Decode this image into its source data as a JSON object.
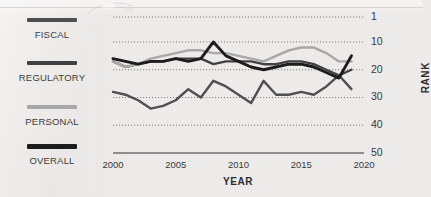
{
  "legend": {
    "items": [
      {
        "label": "FISCAL",
        "color": "#4f4f51"
      },
      {
        "label": "REGULATORY",
        "color": "#414143"
      },
      {
        "label": "PERSONAL",
        "color": "#a8a8a8"
      },
      {
        "label": "OVERALL",
        "color": "#1c1c1c"
      }
    ]
  },
  "axis": {
    "y_title": "RANK",
    "x_title": "YEAR",
    "y_ticks": [
      "1",
      "10",
      "20",
      "30",
      "40",
      "50"
    ],
    "x_ticks": [
      "2000",
      "2005",
      "2010",
      "2015",
      "2020"
    ]
  },
  "chart_data": {
    "type": "line",
    "title": "",
    "xlabel": "YEAR",
    "ylabel": "RANK",
    "xlim": [
      2000,
      2020
    ],
    "ylim": [
      1,
      50
    ],
    "y_inverted": true,
    "grid": "horizontal-dotted",
    "gridlines": [
      1,
      10,
      20,
      30,
      40,
      50
    ],
    "legend_position": "left",
    "x": [
      2000,
      2001,
      2002,
      2003,
      2004,
      2005,
      2006,
      2007,
      2008,
      2009,
      2010,
      2011,
      2012,
      2013,
      2014,
      2015,
      2016,
      2017,
      2018,
      2019
    ],
    "series": [
      {
        "name": "FISCAL",
        "color": "#4f4f51",
        "values": [
          28,
          29,
          31,
          34,
          33,
          31,
          27,
          30,
          24,
          26,
          29,
          32,
          24,
          29,
          29,
          28,
          29,
          26,
          22,
          27
        ]
      },
      {
        "name": "REGULATORY",
        "color": "#414143",
        "values": [
          17,
          19,
          18,
          17,
          17,
          16,
          16,
          16,
          18,
          17,
          17,
          17,
          18,
          18,
          17,
          17,
          18,
          20,
          22,
          20
        ]
      },
      {
        "name": "PERSONAL",
        "color": "#a8a8a8",
        "values": [
          17,
          19,
          18,
          16,
          15,
          14,
          13,
          13,
          14,
          14,
          15,
          16,
          17,
          15,
          13,
          12,
          12,
          14,
          17,
          17
        ]
      },
      {
        "name": "OVERALL",
        "color": "#1c1c1c",
        "values": [
          16,
          17,
          18,
          17,
          17,
          16,
          17,
          16,
          10,
          15,
          17,
          19,
          20,
          19,
          18,
          18,
          19,
          21,
          23,
          15
        ]
      }
    ]
  }
}
